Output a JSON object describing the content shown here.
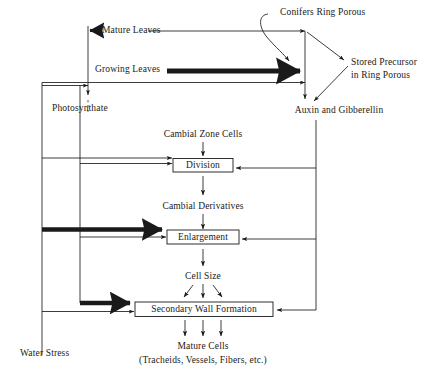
{
  "diagram": {
    "ink_color": "#1a1a1a",
    "background": "#ffffff",
    "nodes": {
      "mature_leaves": "Mature Leaves",
      "growing_leaves": "Growing Leaves",
      "conifers_ring_porous": "Conifers Ring Porous",
      "stored_precursor_line1": "Stored Precursor",
      "stored_precursor_line2": "in Ring Porous",
      "photosynthate": "Photosynthate",
      "auxin_and_gibberellin": "Auxin and Gibberellin",
      "cambial_zone_cells": "Cambial Zone Cells",
      "division": "Division",
      "cambial_derivatives": "Cambial Derivatives",
      "enlargement": "Enlargement",
      "cell_size": "Cell Size",
      "secondary_wall_formation": "Secondary Wall Formation",
      "mature_cells": "Mature Cells",
      "mature_cells_detail": "(Tracheids, Vessels, Fibers, etc.)",
      "water_stress": "Water Stress"
    }
  }
}
